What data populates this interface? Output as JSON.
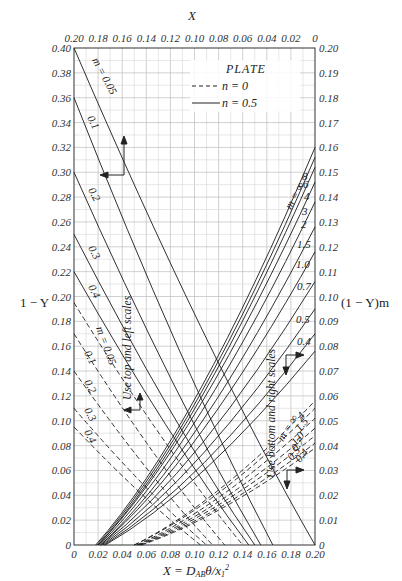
{
  "chart_data": {
    "type": "line",
    "title": "",
    "top_axis": {
      "label": "X",
      "ticks": [
        "0.20",
        "0.18",
        "0.16",
        "0.14",
        "0.12",
        "0.10",
        "0.08",
        "0.06",
        "0.04",
        "0.02",
        "0"
      ],
      "range": [
        0.2,
        0
      ]
    },
    "bottom_axis": {
      "label": "X = D_AB θ/x₁²",
      "ticks": [
        "0",
        "0.02",
        "0.04",
        "0.06",
        "0.08",
        "0.10",
        "0.12",
        "0.14",
        "0.16",
        "0.18",
        "0.20"
      ],
      "range": [
        0,
        0.2
      ]
    },
    "left_axis": {
      "label": "1 − Y",
      "ticks": [
        "0",
        "0.02",
        "0.04",
        "0.06",
        "0.08",
        "0.10",
        "0.12",
        "0.14",
        "0.16",
        "0.18",
        "0.20",
        "0.22",
        "0.24",
        "0.26",
        "0.28",
        "0.30",
        "0.32",
        "0.34",
        "0.36",
        "0.38",
        "0.40"
      ],
      "range": [
        0,
        0.4
      ]
    },
    "right_axis": {
      "label": "(1 − Y)m",
      "ticks": [
        "0",
        "0.01",
        "0.02",
        "0.03",
        "0.04",
        "0.05",
        "0.06",
        "0.07",
        "0.08",
        "0.09",
        "0.10",
        "0.11",
        "0.12",
        "0.13",
        "0.14",
        "0.15",
        "0.16",
        "0.17",
        "0.18",
        "0.19",
        "0.20"
      ],
      "range": [
        0,
        0.2
      ]
    },
    "grid": true,
    "legend": {
      "title": "PLATE",
      "position": "upper-center",
      "entries": [
        {
          "style": "dashed",
          "label": "n = 0"
        },
        {
          "style": "solid",
          "label": "n = 0.5"
        }
      ]
    },
    "annotations": [
      {
        "text": "Use top and left scales",
        "orientation": "vertical"
      },
      {
        "text": "Use bottom and right scales",
        "orientation": "vertical"
      }
    ],
    "series": [
      {
        "group": "top-left",
        "n": 0.5,
        "style": "solid",
        "m": "0.05",
        "label": "m = 0.05",
        "points_top_left": [
          [
            0.2,
            0.4
          ],
          [
            0.0,
            0.0
          ]
        ]
      },
      {
        "group": "top-left",
        "n": 0.5,
        "style": "solid",
        "m": "0.1",
        "label": "0.1",
        "points_top_left": [
          [
            0.2,
            0.36
          ],
          [
            0.035,
            0.0
          ]
        ]
      },
      {
        "group": "top-left",
        "n": 0.5,
        "style": "solid",
        "m": "0.2",
        "label": "0.2",
        "points_top_left": [
          [
            0.2,
            0.3
          ],
          [
            0.045,
            0.0
          ]
        ]
      },
      {
        "group": "top-left",
        "n": 0.5,
        "style": "solid",
        "m": "0.3",
        "label": "0.3",
        "points_top_left": [
          [
            0.2,
            0.25
          ],
          [
            0.05,
            0.0
          ]
        ]
      },
      {
        "group": "top-left",
        "n": 0.5,
        "style": "solid",
        "m": "0.4",
        "label": "0.4",
        "points_top_left": [
          [
            0.2,
            0.22
          ],
          [
            0.055,
            0.0
          ]
        ]
      },
      {
        "group": "top-left",
        "n": 0,
        "style": "dashed",
        "m": "0.05",
        "label": "m = 0.05",
        "points_top_left": [
          [
            0.2,
            0.195
          ],
          [
            0.06,
            0.0
          ]
        ]
      },
      {
        "group": "top-left",
        "n": 0,
        "style": "dashed",
        "m": "0.1",
        "label": "0.1",
        "points_top_left": [
          [
            0.2,
            0.17
          ],
          [
            0.075,
            0.0
          ]
        ]
      },
      {
        "group": "top-left",
        "n": 0,
        "style": "dashed",
        "m": "0.2",
        "label": "0.2",
        "points_top_left": [
          [
            0.2,
            0.14
          ],
          [
            0.085,
            0.0
          ]
        ]
      },
      {
        "group": "top-left",
        "n": 0,
        "style": "dashed",
        "m": "0.3",
        "label": "0.3",
        "points_top_left": [
          [
            0.2,
            0.11
          ],
          [
            0.09,
            0.0
          ]
        ]
      },
      {
        "group": "top-left",
        "n": 0,
        "style": "dashed",
        "m": "0.4",
        "label": "0.4",
        "points_top_left": [
          [
            0.2,
            0.095
          ],
          [
            0.095,
            0.0
          ]
        ]
      },
      {
        "group": "bottom-right",
        "n": 0.5,
        "style": "solid",
        "m": "∞",
        "label": "m = ∞",
        "points_bottom_right": [
          [
            0.018,
            0.0
          ],
          [
            0.2,
            0.16
          ]
        ]
      },
      {
        "group": "bottom-right",
        "n": 0.5,
        "style": "solid",
        "m": "8",
        "label": "8",
        "points_bottom_right": [
          [
            0.019,
            0.0
          ],
          [
            0.2,
            0.156
          ]
        ]
      },
      {
        "group": "bottom-right",
        "n": 0.5,
        "style": "solid",
        "m": "6",
        "label": "6",
        "points_bottom_right": [
          [
            0.02,
            0.0
          ],
          [
            0.2,
            0.152
          ]
        ]
      },
      {
        "group": "bottom-right",
        "n": 0.5,
        "style": "solid",
        "m": "4",
        "label": "4",
        "points_bottom_right": [
          [
            0.02,
            0.0
          ],
          [
            0.2,
            0.146
          ]
        ]
      },
      {
        "group": "bottom-right",
        "n": 0.5,
        "style": "solid",
        "m": "3",
        "label": "3",
        "points_bottom_right": [
          [
            0.021,
            0.0
          ],
          [
            0.2,
            0.138
          ]
        ]
      },
      {
        "group": "bottom-right",
        "n": 0.5,
        "style": "solid",
        "m": "2",
        "label": "2",
        "points_bottom_right": [
          [
            0.022,
            0.0
          ],
          [
            0.2,
            0.128
          ]
        ]
      },
      {
        "group": "bottom-right",
        "n": 0.5,
        "style": "solid",
        "m": "1.5",
        "label": "1.5",
        "points_bottom_right": [
          [
            0.022,
            0.0
          ],
          [
            0.2,
            0.118
          ]
        ]
      },
      {
        "group": "bottom-right",
        "n": 0.5,
        "style": "solid",
        "m": "1.0",
        "label": "1.0",
        "points_bottom_right": [
          [
            0.023,
            0.0
          ],
          [
            0.2,
            0.106
          ]
        ]
      },
      {
        "group": "bottom-right",
        "n": 0.5,
        "style": "solid",
        "m": "0.7",
        "label": "0.7",
        "points_bottom_right": [
          [
            0.024,
            0.0
          ],
          [
            0.2,
            0.095
          ]
        ]
      },
      {
        "group": "bottom-right",
        "n": 0.5,
        "style": "solid",
        "m": "0.5",
        "label": "0.5",
        "points_bottom_right": [
          [
            0.025,
            0.0
          ],
          [
            0.2,
            0.085
          ]
        ]
      },
      {
        "group": "bottom-right",
        "n": 0.5,
        "style": "solid",
        "m": "0.4",
        "label": "0.4",
        "points_bottom_right": [
          [
            0.026,
            0.0
          ],
          [
            0.2,
            0.078
          ]
        ]
      },
      {
        "group": "bottom-right",
        "n": 0,
        "style": "dashed",
        "m": "∞",
        "label": "m = ∞",
        "points_bottom_right": [
          [
            0.05,
            0.0
          ],
          [
            0.2,
            0.058
          ]
        ]
      },
      {
        "group": "bottom-right",
        "n": 0,
        "style": "dashed",
        "m": "4",
        "label": "4",
        "points_bottom_right": [
          [
            0.05,
            0.0
          ],
          [
            0.2,
            0.055
          ]
        ]
      },
      {
        "group": "bottom-right",
        "n": 0,
        "style": "dashed",
        "m": "1.5",
        "label": "1.5",
        "points_bottom_right": [
          [
            0.052,
            0.0
          ],
          [
            0.2,
            0.051
          ]
        ]
      },
      {
        "group": "bottom-right",
        "n": 0,
        "style": "dashed",
        "m": "1.0",
        "label": "1.0",
        "points_bottom_right": [
          [
            0.053,
            0.0
          ],
          [
            0.2,
            0.047
          ]
        ]
      },
      {
        "group": "bottom-right",
        "n": 0,
        "style": "dashed",
        "m": "0.7",
        "label": "0.7",
        "points_bottom_right": [
          [
            0.054,
            0.0
          ],
          [
            0.2,
            0.044
          ]
        ]
      },
      {
        "group": "bottom-right",
        "n": 0,
        "style": "dashed",
        "m": "0.5",
        "label": "0.5",
        "points_bottom_right": [
          [
            0.055,
            0.0
          ],
          [
            0.2,
            0.041
          ]
        ]
      },
      {
        "group": "bottom-right",
        "n": 0,
        "style": "dashed",
        "m": "0.4",
        "label": "0.4",
        "points_bottom_right": [
          [
            0.056,
            0.0
          ],
          [
            0.2,
            0.039
          ]
        ]
      }
    ]
  },
  "labels": {
    "top_axis_title": "X",
    "left_axis_title": "1 − Y",
    "right_axis_title": "(1 − Y)m",
    "bottom_axis_title": "X = D",
    "bottom_axis_title_sub": "AB",
    "bottom_axis_title_rest": "θ/x",
    "bottom_axis_title_sub2": "1",
    "bottom_axis_title_sup": "2",
    "legend_title": "PLATE",
    "legend_dashed": "n = 0",
    "legend_solid": "n = 0.5",
    "note_left": "Use top and left scales",
    "note_right": "Use bottom and right scales",
    "solid_left_first": "m = 0.05",
    "solid_left_rest": [
      "0.1",
      "0.2",
      "0.3",
      "0.4"
    ],
    "dashed_left_first": "m = 0.05",
    "dashed_left_rest": [
      "0.1",
      "0.2",
      "0.3",
      "0.4"
    ],
    "solid_right_first": "m = ∞",
    "solid_right_rest": [
      "8",
      "6",
      "4",
      "3",
      "2",
      "1.5",
      "1.0",
      "0.7",
      "0.5",
      "0.4"
    ],
    "dashed_right_first": "m = ∞",
    "dashed_right_rest": [
      "4",
      "1.5",
      "1.0",
      "0.7",
      "0.5",
      "0.4"
    ]
  }
}
